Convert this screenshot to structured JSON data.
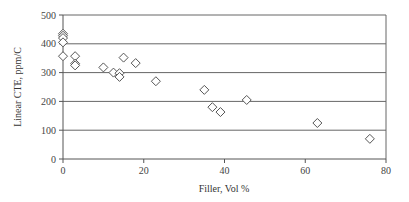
{
  "chart_data": {
    "type": "scatter",
    "title": "",
    "xlabel": "Filler, Vol %",
    "ylabel": "Linear CTE, ppm/C",
    "xlim": [
      0,
      80
    ],
    "ylim": [
      0,
      500
    ],
    "x_ticks": [
      0,
      20,
      40,
      60,
      80
    ],
    "y_ticks": [
      0,
      100,
      200,
      300,
      400,
      500
    ],
    "grid": "horizontal",
    "legend": null,
    "marker": "diamond-open",
    "series": [
      {
        "name": "Linear CTE",
        "points": [
          {
            "x": 0,
            "y": 435
          },
          {
            "x": 0,
            "y": 428
          },
          {
            "x": 0,
            "y": 420
          },
          {
            "x": 0,
            "y": 405
          },
          {
            "x": 0,
            "y": 357
          },
          {
            "x": 3,
            "y": 357
          },
          {
            "x": 3,
            "y": 331
          },
          {
            "x": 3,
            "y": 325
          },
          {
            "x": 10,
            "y": 318
          },
          {
            "x": 12.5,
            "y": 300
          },
          {
            "x": 14,
            "y": 298
          },
          {
            "x": 14,
            "y": 285
          },
          {
            "x": 15,
            "y": 352
          },
          {
            "x": 18,
            "y": 333
          },
          {
            "x": 23,
            "y": 270
          },
          {
            "x": 35,
            "y": 240
          },
          {
            "x": 37,
            "y": 180
          },
          {
            "x": 39,
            "y": 163
          },
          {
            "x": 45.5,
            "y": 205
          },
          {
            "x": 63,
            "y": 125
          },
          {
            "x": 76,
            "y": 70
          }
        ]
      }
    ]
  },
  "colors": {
    "axis": "#555555",
    "grid": "#666666",
    "marker_stroke": "#555555",
    "marker_fill": "#ffffff"
  }
}
